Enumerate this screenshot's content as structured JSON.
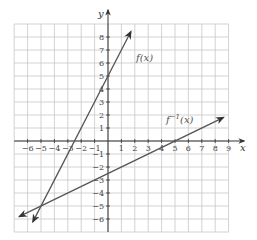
{
  "chart_data": {
    "type": "line",
    "title": "",
    "xlabel": "x",
    "ylabel": "y",
    "xlim": [
      -7,
      9
    ],
    "ylim": [
      -7,
      9
    ],
    "grid": true,
    "x_ticks": [
      -6,
      -5,
      -4,
      -3,
      -2,
      -1,
      1,
      2,
      3,
      4,
      5,
      6,
      7,
      8,
      9
    ],
    "y_ticks": [
      -6,
      -5,
      -4,
      -3,
      -2,
      -1,
      1,
      2,
      3,
      4,
      5,
      6,
      7,
      8
    ],
    "x_tick_labels": [
      "−6",
      "−5",
      "−4",
      "−3",
      "−2",
      "−1",
      "1",
      "2",
      "3",
      "4",
      "5",
      "6",
      "7",
      "8",
      "9"
    ],
    "y_tick_labels": [
      "−6",
      "−5",
      "−4",
      "−3",
      "−2",
      "−1",
      "1",
      "2",
      "3",
      "4",
      "5",
      "6",
      "7",
      "8"
    ],
    "series": [
      {
        "name": "f(x)",
        "label": "f(x)",
        "equation": "y = 2x + 5",
        "slope": 2,
        "intercept": 5,
        "x": [
          -5.6,
          1.7
        ],
        "y": [
          -6.2,
          8.4
        ],
        "color": "#555555"
      },
      {
        "name": "f^-1(x)",
        "label": "f⁻¹(x)",
        "equation": "y = (x - 5) / 2",
        "slope": 0.5,
        "intercept": -2.5,
        "x": [
          -6.6,
          8.6
        ],
        "y": [
          -5.8,
          1.8
        ],
        "color": "#555555"
      }
    ],
    "annotations": [
      {
        "text": "f(x)",
        "x": 2.1,
        "y": 6.4
      },
      {
        "text": "f⁻¹(x)",
        "x": 4.3,
        "y": 1.4
      },
      {
        "text": "intersection",
        "x": -5,
        "y": -5
      }
    ],
    "legend": null
  },
  "labels": {
    "x_axis": "x",
    "y_axis": "y",
    "f_label": "f(x)",
    "finv_base": "f",
    "finv_sup": "−1",
    "finv_arg": "(x)"
  }
}
